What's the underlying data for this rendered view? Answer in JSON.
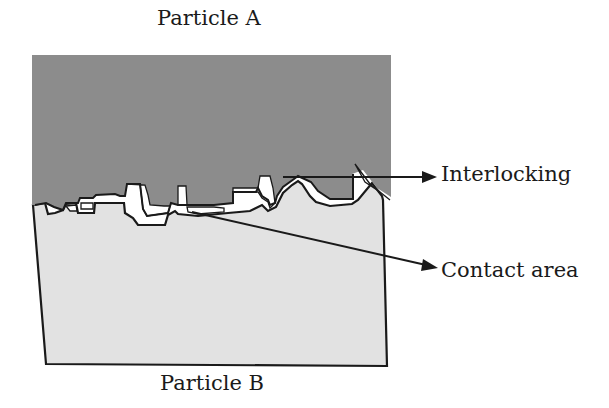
{
  "diagram": {
    "particles": [
      {
        "id": "A",
        "label": "Particle A",
        "fill": "#8c8c8c",
        "position": "top"
      },
      {
        "id": "B",
        "label": "Particle B",
        "fill": "#e2e2e2",
        "position": "bottom"
      }
    ],
    "annotations": [
      {
        "id": "interlocking",
        "label": "Interlocking",
        "arrow": "right"
      },
      {
        "id": "contact_area",
        "label": "Contact area",
        "arrow": "right"
      }
    ],
    "colors": {
      "particle_a": "#8c8c8c",
      "particle_b": "#e2e2e2",
      "outline": "#1a1a1a",
      "void": "#ffffff"
    }
  }
}
